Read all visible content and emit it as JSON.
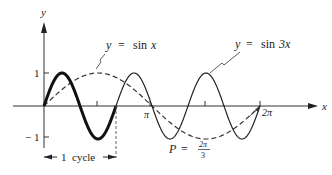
{
  "chart_data": {
    "type": "line",
    "title": "",
    "xlabel": "x",
    "ylabel": "y",
    "xlim": [
      0,
      6.2832
    ],
    "ylim": [
      -1,
      1
    ],
    "grid": false,
    "x_ticks": [
      {
        "value": 1.5708,
        "label": ""
      },
      {
        "value": 3.1416,
        "label": "π"
      },
      {
        "value": 4.7124,
        "label": ""
      },
      {
        "value": 6.2832,
        "label": "2π"
      }
    ],
    "y_ticks": [
      {
        "value": 1,
        "label": "1"
      },
      {
        "value": -1,
        "label": "− 1"
      }
    ],
    "series": [
      {
        "name": "y = sin x",
        "style": "dashed",
        "function": "sin(x)",
        "x_range": [
          0,
          6.2832
        ]
      },
      {
        "name": "y = sin 3x",
        "style": "solid",
        "function": "sin(3x)",
        "x_range": [
          0,
          6.2832
        ],
        "highlighted_first_cycle": [
          0,
          2.0944
        ]
      }
    ],
    "annotations": [
      {
        "text": "y = sin x",
        "points_to": "dashed curve near x=π/2"
      },
      {
        "text": "y = sin 3x",
        "points_to": "solid curve peak near x=3π/2"
      },
      {
        "text": "1 cycle",
        "span": [
          0,
          2.0944
        ]
      },
      {
        "text": "P = 2π/3",
        "points_to": "solid curve"
      }
    ]
  },
  "labels": {
    "y_axis": "y",
    "x_axis": "x",
    "tick_one": "1",
    "tick_minus_one": "− 1",
    "tick_pi": "π",
    "tick_two_pi": "2π",
    "sinx_label_y": "y",
    "sinx_label_eq": "=",
    "sinx_label_fn": "sin",
    "sinx_label_var": "x",
    "sin3x_label_y": "y",
    "sin3x_label_eq": "=",
    "sin3x_label_fn": "sin",
    "sin3x_label_var": "3x",
    "cycle_num": "1",
    "cycle_word": "cycle",
    "period_p": "P",
    "period_eq": "=",
    "period_num": "2π",
    "period_den": "3"
  }
}
